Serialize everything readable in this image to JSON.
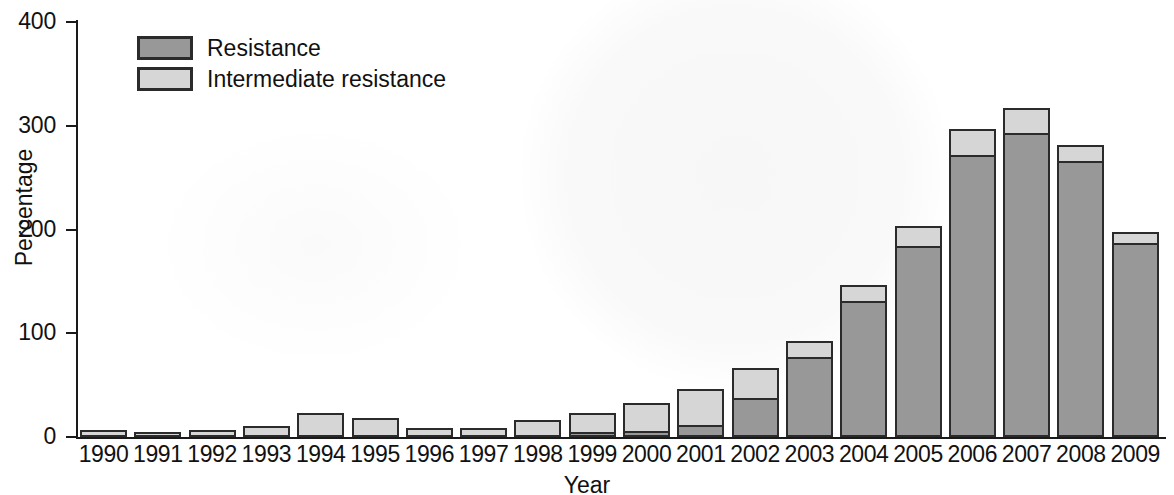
{
  "chart_data": {
    "type": "bar",
    "subtype": "stacked-vertical",
    "title": "",
    "xlabel": "Year",
    "ylabel": "Percentage",
    "ylim": [
      0,
      400
    ],
    "yticks": [
      0,
      100,
      200,
      300,
      400
    ],
    "ytick_labels": [
      "0",
      "100",
      "200",
      "300",
      "400"
    ],
    "grid": false,
    "legend_position": "top-left",
    "categories": [
      "1990",
      "1991",
      "1992",
      "1993",
      "1994",
      "1995",
      "1996",
      "1997",
      "1998",
      "1999",
      "2000",
      "2001",
      "2002",
      "2003",
      "2004",
      "2005",
      "2006",
      "2007",
      "2008",
      "2009"
    ],
    "series": [
      {
        "name": "Resistance",
        "color": "#989898",
        "values": [
          0,
          0,
          0,
          0,
          0,
          0,
          0,
          0,
          0,
          4,
          5,
          11,
          37,
          76,
          130,
          183,
          271,
          292,
          265,
          186
        ]
      },
      {
        "name": "Intermediate resistance",
        "color": "#d6d6d6",
        "values": [
          7,
          5,
          7,
          11,
          23,
          18,
          9,
          9,
          16,
          19,
          28,
          35,
          30,
          17,
          17,
          20,
          26,
          25,
          16,
          12
        ]
      }
    ],
    "totals": [
      7,
      5,
      7,
      11,
      23,
      18,
      9,
      9,
      16,
      23,
      33,
      46,
      67,
      93,
      147,
      203,
      297,
      317,
      281,
      198
    ]
  },
  "legend": {
    "items": [
      {
        "label": "Resistance",
        "swatch": "resistance-swatch"
      },
      {
        "label": "Intermediate resistance",
        "swatch": "intermediate-resistance-swatch"
      }
    ]
  },
  "axes": {
    "y_title": "Percentage",
    "x_title": "Year"
  }
}
